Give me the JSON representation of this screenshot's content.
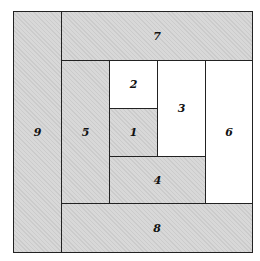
{
  "diagram": {
    "blocks": [
      {
        "id": "1",
        "label": "1",
        "fill": "shaded"
      },
      {
        "id": "2",
        "label": "2",
        "fill": "white"
      },
      {
        "id": "3",
        "label": "3",
        "fill": "white"
      },
      {
        "id": "4",
        "label": "4",
        "fill": "shaded"
      },
      {
        "id": "5",
        "label": "5",
        "fill": "shaded"
      },
      {
        "id": "6",
        "label": "6",
        "fill": "white"
      },
      {
        "id": "7",
        "label": "7",
        "fill": "shaded"
      },
      {
        "id": "8",
        "label": "8",
        "fill": "shaded"
      },
      {
        "id": "9",
        "label": "9",
        "fill": "shaded"
      }
    ],
    "colors": {
      "shaded": "#d8d8d8",
      "white": "#ffffff",
      "line": "#222222"
    }
  }
}
